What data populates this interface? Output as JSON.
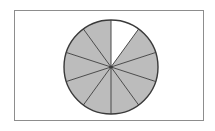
{
  "figure": {
    "frame": {
      "x": 14,
      "y": 10,
      "width": 190,
      "height": 111,
      "border_color": "#8d8d8d",
      "background_color": "#ffffff"
    }
  },
  "colors": {
    "shaded_fill": "#bcbcbc",
    "unshaded_fill": "#ffffff",
    "outline": "#3a3a3a",
    "divider": "#4a4a4a",
    "frame_border": "#8d8d8d",
    "page_background": "#ffffff"
  },
  "chart_data": {
    "type": "pie",
    "title": "",
    "subtitle": "",
    "xlabel": "",
    "ylabel": "",
    "legend_position": "none",
    "grid": false,
    "total_slices": 10,
    "slice_angle_degrees": 36,
    "start_angle_degrees": 0,
    "direction": "clockwise",
    "shaded_count": 9,
    "unshaded_count": 1,
    "fraction_shaded": "9/10",
    "fraction_unshaded": "1/10",
    "percent_shaded": 90,
    "percent_unshaded": 10,
    "center_x": 111,
    "center_y": 67,
    "radius": 47,
    "categories": [
      "slice-1",
      "slice-2",
      "slice-3",
      "slice-4",
      "slice-5",
      "slice-6",
      "slice-7",
      "slice-8",
      "slice-9",
      "slice-10"
    ],
    "values": [
      10,
      10,
      10,
      10,
      10,
      10,
      10,
      10,
      10,
      10
    ],
    "slices": [
      {
        "index": 1,
        "start_deg": 0,
        "end_deg": 36,
        "shaded": false,
        "fill": "#ffffff"
      },
      {
        "index": 2,
        "start_deg": 36,
        "end_deg": 72,
        "shaded": true,
        "fill": "#bcbcbc"
      },
      {
        "index": 3,
        "start_deg": 72,
        "end_deg": 108,
        "shaded": true,
        "fill": "#bcbcbc"
      },
      {
        "index": 4,
        "start_deg": 108,
        "end_deg": 144,
        "shaded": true,
        "fill": "#bcbcbc"
      },
      {
        "index": 5,
        "start_deg": 144,
        "end_deg": 180,
        "shaded": true,
        "fill": "#bcbcbc"
      },
      {
        "index": 6,
        "start_deg": 180,
        "end_deg": 216,
        "shaded": true,
        "fill": "#bcbcbc"
      },
      {
        "index": 7,
        "start_deg": 216,
        "end_deg": 252,
        "shaded": true,
        "fill": "#bcbcbc"
      },
      {
        "index": 8,
        "start_deg": 252,
        "end_deg": 288,
        "shaded": true,
        "fill": "#bcbcbc"
      },
      {
        "index": 9,
        "start_deg": 288,
        "end_deg": 324,
        "shaded": true,
        "fill": "#bcbcbc"
      },
      {
        "index": 10,
        "start_deg": 324,
        "end_deg": 360,
        "shaded": true,
        "fill": "#bcbcbc"
      }
    ]
  }
}
